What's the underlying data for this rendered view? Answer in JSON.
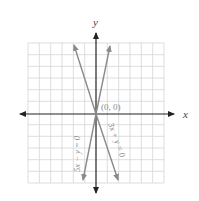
{
  "figure": {
    "x_axis_label": "x",
    "y_axis_label": "y",
    "origin_label": "(0, 0)",
    "grid": {
      "columns": 12,
      "rows": 12,
      "color": "#d4d4d4"
    },
    "colors": {
      "axis": "#222222",
      "line": "#8a8a8a",
      "label": "#8a8a8a"
    },
    "lines": [
      {
        "equation": "5x − y = 0",
        "slope": 5
      },
      {
        "equation": "3x + y = 0",
        "slope": -3
      }
    ]
  }
}
